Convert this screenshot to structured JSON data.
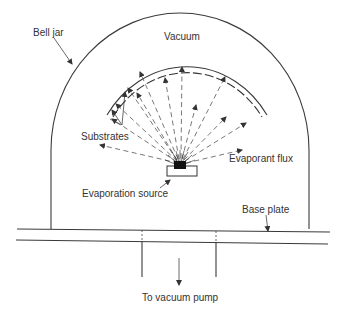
{
  "diagram": {
    "labels": {
      "bell_jar": "Bell jar",
      "vacuum": "Vacuum",
      "substrates": "Substrates",
      "evaporant_flux": "Evaporant flux",
      "evaporation_source": "Evaporation source",
      "base_plate": "Base plate",
      "to_vacuum_pump": "To vacuum pump"
    },
    "colors": {
      "line": "#3a3a3a",
      "text": "#333333",
      "background": "#ffffff"
    }
  }
}
